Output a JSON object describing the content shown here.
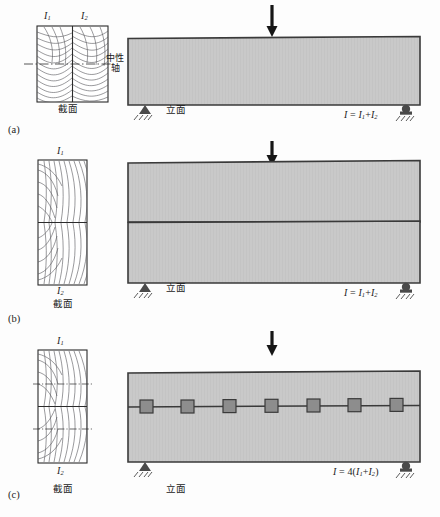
{
  "figure": {
    "title_note": "Composite timber beam bending stiffness comparison diagram",
    "colors": {
      "beam_fill": "#c9c9c9",
      "beam_stroke": "#3a3a3a",
      "section_stroke": "#2b2b2b",
      "grain_stroke": "#55555a",
      "connector_fill": "#8d8d8d",
      "connector_stroke": "#3a3a3a",
      "support_fill": "#4a4a4a",
      "arrow_fill": "#161616",
      "page_bg": "#fdfdfd"
    }
  },
  "panels": [
    {
      "id": "a",
      "panel_label": "(a)",
      "section_caption": "截面",
      "elevation_caption": "立面",
      "neutral_axis_label_line1": "中性",
      "neutral_axis_label_line2": "轴",
      "inertia_top_left": "I",
      "inertia_top_left_sub": "1",
      "inertia_top_right": "I",
      "inertia_top_right_sub": "2",
      "formula_main": "I",
      "formula_eq": "=",
      "formula_term1": "I",
      "formula_term1_sub": "1",
      "formula_plus": "+",
      "formula_term2": "I",
      "formula_term2_sub": "2",
      "formula_text": "I = I1+I2",
      "split": "vertical",
      "connectors": 0
    },
    {
      "id": "b",
      "panel_label": "(b)",
      "section_caption": "截面",
      "elevation_caption": "立面",
      "inertia_top": "I",
      "inertia_top_sub": "1",
      "inertia_bottom": "I",
      "inertia_bottom_sub": "2",
      "formula_main": "I",
      "formula_eq": "=",
      "formula_term1": "I",
      "formula_term1_sub": "1",
      "formula_plus": "+",
      "formula_term2": "I",
      "formula_term2_sub": "2",
      "formula_text": "I = I1+I2",
      "split": "horizontal",
      "connectors": 0
    },
    {
      "id": "c",
      "panel_label": "(c)",
      "section_caption": "截面",
      "elevation_caption": "立面",
      "inertia_top": "I",
      "inertia_top_sub": "1",
      "inertia_bottom": "I",
      "inertia_bottom_sub": "2",
      "formula_main": "I",
      "formula_eq": "=",
      "formula_coeff": "4(",
      "formula_term1": "I",
      "formula_term1_sub": "1",
      "formula_plus": "+",
      "formula_term2": "I",
      "formula_term2_sub": "2",
      "formula_close": ")",
      "formula_text": "I = 4(I1+I2)",
      "split": "horizontal",
      "connectors": 7
    }
  ]
}
